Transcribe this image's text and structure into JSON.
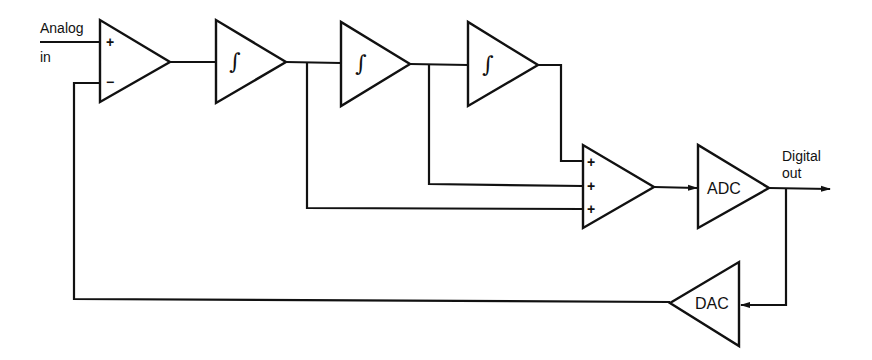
{
  "diagram": {
    "type": "sigma-delta modulator block diagram",
    "input_label_line1": "Analog",
    "input_label_line2": "in",
    "output_label_line1": "Digital",
    "output_label_line2": "out",
    "blocks": {
      "input_summer": {
        "plus": "+",
        "minus": "−"
      },
      "integrator_1": {
        "symbol": "∫"
      },
      "integrator_2": {
        "symbol": "∫"
      },
      "integrator_3": {
        "symbol": "∫"
      },
      "output_summer": {
        "in1": "+",
        "in2": "+",
        "in3": "+"
      },
      "adc": {
        "label": "ADC"
      },
      "dac": {
        "label": "DAC"
      }
    },
    "connections": [
      "Analog in -> input_summer(+)",
      "input_summer -> integrator_1",
      "integrator_1 -> integrator_2",
      "integrator_2 -> integrator_3",
      "integrator_3 -> output_summer(+1)",
      "integrator_2 -> output_summer(+2)",
      "integrator_1 -> output_summer(+3)",
      "output_summer -> ADC",
      "ADC -> Digital out",
      "ADC -> DAC",
      "DAC -> input_summer(−)"
    ]
  }
}
